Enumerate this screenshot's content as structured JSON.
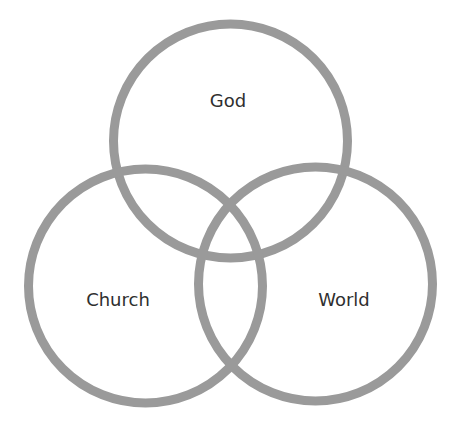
{
  "diagram": {
    "type": "venn",
    "stroke_color": "#9a9a9a",
    "text_color": "#2f2f2f",
    "stroke_width": 9,
    "circles": [
      {
        "id": "god",
        "label": "God",
        "cx": 230.5,
        "cy": 141,
        "r": 117,
        "label_x": 228,
        "label_y": 107
      },
      {
        "id": "church",
        "label": "Church",
        "cx": 145.5,
        "cy": 286,
        "r": 117,
        "label_x": 118,
        "label_y": 306
      },
      {
        "id": "world",
        "label": "World",
        "cx": 315.5,
        "cy": 284,
        "r": 117,
        "label_x": 344,
        "label_y": 306
      }
    ]
  }
}
